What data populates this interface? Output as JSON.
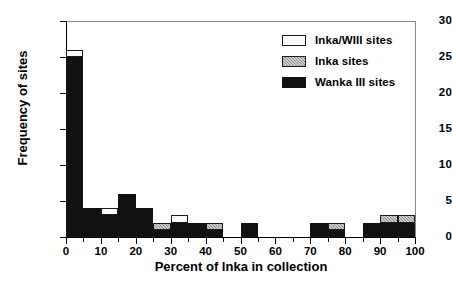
{
  "chart_data": {
    "type": "bar",
    "subtype": "stacked-histogram",
    "title": "",
    "xlabel": "Percent of Inka in collection",
    "ylabel": "Frequency of sites",
    "xlim": [
      0,
      100
    ],
    "ylim": [
      0,
      30
    ],
    "ytick_values": [
      0,
      5,
      10,
      15,
      20,
      25,
      30
    ],
    "ytick_labels": [
      "0",
      "5",
      "10",
      "15",
      "20",
      "25",
      "30"
    ],
    "xtick_values": [
      0,
      10,
      20,
      30,
      40,
      50,
      60,
      70,
      80,
      90,
      100
    ],
    "xtick_labels": [
      "0",
      "10",
      "20",
      "30",
      "40",
      "50",
      "60",
      "70",
      "80",
      "90",
      "100"
    ],
    "xtick_minor_values": [
      5,
      15,
      25,
      35,
      45,
      55,
      65,
      75,
      85,
      95
    ],
    "grid": false,
    "legend_position": "top-right",
    "bin_width": 5,
    "bin_starts": [
      0,
      5,
      10,
      15,
      20,
      25,
      30,
      35,
      40,
      45,
      50,
      55,
      60,
      65,
      70,
      75,
      80,
      85,
      90,
      95
    ],
    "series": [
      {
        "name": "Wanka III sites",
        "color": "#111111",
        "values": [
          25,
          4,
          3,
          6,
          4,
          1,
          2,
          2,
          1,
          0,
          2,
          0,
          0,
          0,
          2,
          1,
          0,
          2,
          2,
          2
        ]
      },
      {
        "name": "Inka sites",
        "color": "#8d8d8d",
        "values": [
          0,
          0,
          0,
          0,
          0,
          1,
          0,
          0,
          1,
          0,
          0,
          0,
          0,
          0,
          0,
          1,
          0,
          0,
          1,
          1
        ]
      },
      {
        "name": "Inka/WIII sites",
        "color": "#fbfbfb",
        "values": [
          1,
          0,
          1,
          0,
          0,
          0,
          1,
          0,
          0,
          0,
          0,
          0,
          0,
          0,
          0,
          0,
          0,
          0,
          0,
          0
        ]
      }
    ],
    "totals": [
      26,
      4,
      4,
      6,
      4,
      2,
      3,
      2,
      2,
      0,
      2,
      0,
      0,
      0,
      2,
      2,
      0,
      2,
      3,
      3
    ]
  },
  "legend": {
    "items": [
      {
        "label": "Inka/WIII sites",
        "swatch": "light-swatch-icon"
      },
      {
        "label": "Inka sites",
        "swatch": "hatched-swatch-icon"
      },
      {
        "label": "Wanka III sites",
        "swatch": "dark-swatch-icon"
      }
    ]
  }
}
